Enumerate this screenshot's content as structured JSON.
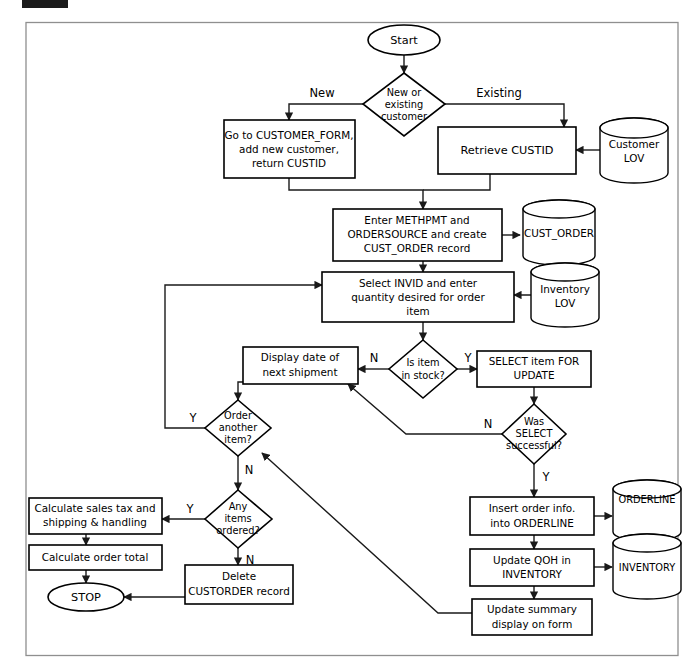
{
  "figure": {
    "background_color": "#ffffff",
    "frame_color": "#8f8f8f",
    "line_color": "#1a1a1a"
  },
  "marker": {
    "label": ""
  },
  "nodes": {
    "start": {
      "label": "Start",
      "shape": "terminator"
    },
    "stop": {
      "label": "STOP",
      "shape": "terminator"
    },
    "new_or_existing": {
      "line1": "New or",
      "line2": "existing",
      "line3": "customer",
      "shape": "decision"
    },
    "goto_customer_form": {
      "line1": "Go to CUSTOMER_FORM,",
      "line2": "add new customer,",
      "line3": "return CUSTID",
      "shape": "process"
    },
    "retrieve_custid": {
      "line1": "Retrieve CUSTID",
      "shape": "process"
    },
    "enter_methpmt": {
      "line1": "Enter METHPMT and",
      "line2": "ORDERSOURCE and create",
      "line3": "CUST_ORDER record",
      "shape": "process"
    },
    "select_invid": {
      "line1": "Select INVID and enter",
      "line2": "quantity desired for order",
      "line3": "item",
      "shape": "process"
    },
    "is_item_in_stock": {
      "line1": "Is item",
      "line2": "in stock?",
      "shape": "decision"
    },
    "display_date": {
      "line1": "Display date of",
      "line2": "next shipment",
      "shape": "process"
    },
    "select_item_for_update": {
      "line1": "SELECT item FOR",
      "line2": "UPDATE",
      "shape": "process"
    },
    "was_select_successful": {
      "line1": "Was",
      "line2": "SELECT",
      "line3": "successful?",
      "shape": "decision"
    },
    "order_another_item": {
      "line1": "Order",
      "line2": "another",
      "line3": "item?",
      "shape": "decision"
    },
    "any_items_ordered": {
      "line1": "Any",
      "line2": "items",
      "line3": "ordered?",
      "shape": "decision"
    },
    "calculate_sales_tax": {
      "line1": "Calculate sales tax and",
      "line2": "shipping & handling",
      "shape": "process"
    },
    "calculate_order_total": {
      "line1": "Calculate order total",
      "shape": "process"
    },
    "delete_custorder": {
      "line1": "Delete",
      "line2": "CUSTORDER record",
      "shape": "process"
    },
    "insert_order_info": {
      "line1": "Insert order info.",
      "line2": "into ORDERLINE",
      "shape": "process"
    },
    "update_qoh": {
      "line1": "Update QOH in",
      "line2": "INVENTORY",
      "shape": "process"
    },
    "update_summary": {
      "line1": "Update summary",
      "line2": "display on form",
      "shape": "process"
    }
  },
  "datastores": {
    "customer_lov": {
      "line1": "Customer",
      "line2": "LOV",
      "shape": "cylinder"
    },
    "cust_order": {
      "line1": "CUST_ORDER",
      "shape": "cylinder"
    },
    "inventory_lov": {
      "line1": "Inventory",
      "line2": "LOV",
      "shape": "cylinder"
    },
    "orderline": {
      "line1": "ORDERLINE",
      "shape": "cylinder"
    },
    "inventory": {
      "line1": "INVENTORY",
      "shape": "cylinder"
    }
  },
  "edge_labels": {
    "new": "New",
    "existing": "Existing",
    "in_stock_no": "N",
    "in_stock_yes": "Y",
    "select_ok_no": "N",
    "select_ok_yes": "Y",
    "order_another_yes": "Y",
    "order_another_no": "N",
    "any_items_yes": "Y",
    "any_items_no": "N"
  }
}
